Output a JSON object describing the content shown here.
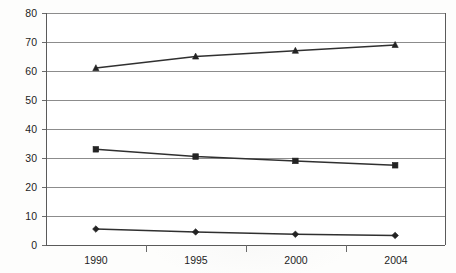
{
  "chart_data": {
    "type": "line",
    "title": "",
    "subtitle": "",
    "xlabel": "",
    "ylabel": "",
    "categories": [
      "1990",
      "1995",
      "2000",
      "2004"
    ],
    "ylim": [
      0,
      80
    ],
    "ytick_step": 10,
    "yticks": [
      "0",
      "10",
      "20",
      "30",
      "40",
      "50",
      "60",
      "70",
      "80"
    ],
    "grid": "horizontal",
    "legend": "none",
    "series": [
      {
        "name": "series-1-triangle",
        "marker": "triangle",
        "color": "#232323",
        "values": [
          61,
          65,
          67,
          69
        ]
      },
      {
        "name": "series-2-square",
        "marker": "square",
        "color": "#232323",
        "values": [
          33,
          30.5,
          29,
          27.5
        ]
      },
      {
        "name": "series-3-diamond",
        "marker": "diamond",
        "color": "#232323",
        "values": [
          5.5,
          4.5,
          3.7,
          3.3
        ]
      }
    ]
  },
  "axes": {
    "y_tick_labels": [
      "80",
      "70",
      "60",
      "50",
      "40",
      "30",
      "20",
      "10",
      "0"
    ],
    "x_tick_labels": [
      "1990",
      "1995",
      "2000",
      "2004"
    ]
  },
  "colors": {
    "background": "#fdfdfc",
    "gridline": "#8c8c8c",
    "axis": "#5a5a5a",
    "series": "#232323",
    "text": "#1d1d1d"
  }
}
